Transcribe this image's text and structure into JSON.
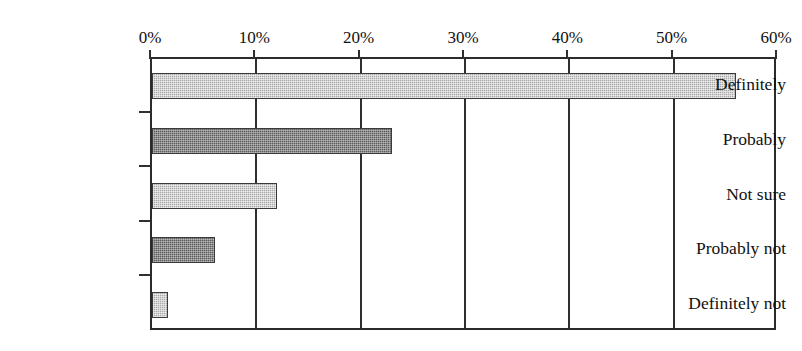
{
  "chart_data": {
    "type": "bar",
    "orientation": "horizontal",
    "title": "",
    "subtitle": "",
    "xlabel": "",
    "ylabel": "",
    "categories": [
      "Definitely",
      "Probably",
      "Not sure",
      "Probably not",
      "Definitely not"
    ],
    "values": [
      56,
      23,
      12,
      6,
      1.5
    ],
    "value_unit": "%",
    "xlim": [
      0,
      60
    ],
    "xticks": [
      0,
      10,
      20,
      30,
      40,
      50,
      60
    ],
    "xtick_labels": [
      "0%",
      "10%",
      "20%",
      "30%",
      "40%",
      "50%",
      "60%"
    ],
    "grid": true,
    "grid_axis": "x",
    "legend": false,
    "legend_position": "none",
    "bar_fills": [
      "light-hatch",
      "dark-hatch",
      "light-hatch",
      "dark-hatch",
      "light-hatch"
    ],
    "colors": {
      "light_bar": "#a8a8a8",
      "dark_bar": "#5c5c5c",
      "axis": "#2f2f2f",
      "text": "#111111",
      "background": "#ffffff"
    },
    "series": [
      {
        "name": "Response share",
        "values": [
          56,
          23,
          12,
          6,
          1.5
        ]
      }
    ]
  },
  "artifacts": {
    "top_clipped_text": "· · ·"
  }
}
